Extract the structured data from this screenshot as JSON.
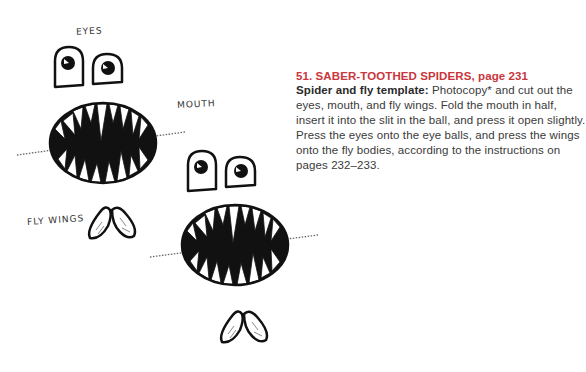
{
  "labels": {
    "eyes": "EYES",
    "mouth": "MOUTH",
    "fly_wings": "FLY WINGS"
  },
  "section": {
    "heading": "51. SABER-TOOTHED SPIDERS, page 231",
    "lead": "Spider and fly template:",
    "body": " Photocopy* and cut out the eyes, mouth, and fly wings. Fold the mouth in half, insert it into the slit in the ball, and press it open slightly. Press the eyes onto the eye balls, and press the wings onto the fly bodies, according to the instructions on pages 232–233."
  },
  "colors": {
    "heading": "#c9363c",
    "body": "#3a3a3a",
    "ink": "#111111"
  }
}
